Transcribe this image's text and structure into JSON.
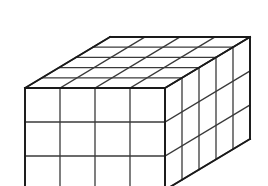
{
  "figure": {
    "shape_name": "cuboid",
    "projection": "oblique",
    "background_color": "#ffffff",
    "line_color": "#2b2b2b",
    "face_color": "#ffffff",
    "caption": ""
  },
  "chart_data": {
    "type": "diagram",
    "shape": "rectangular prism (cuboid)",
    "units": "unit cubes",
    "dimensions": {
      "width_cubes": 4,
      "height_cubes": 3,
      "depth_cubes": 5
    },
    "total_cubes": 60,
    "faces": [
      {
        "name": "front",
        "visible": true,
        "rows": 3,
        "columns": 4,
        "cells": 12
      },
      {
        "name": "right",
        "visible": true,
        "rows": 3,
        "columns": 5,
        "cells": 15
      },
      {
        "name": "top",
        "visible": true,
        "rows": 5,
        "columns": 4,
        "cells": 20
      },
      {
        "name": "back",
        "visible": false,
        "rows": 3,
        "columns": 4,
        "cells": 12
      },
      {
        "name": "left",
        "visible": false,
        "rows": 3,
        "columns": 5,
        "cells": 15
      },
      {
        "name": "bottom",
        "visible": false,
        "rows": 5,
        "columns": 4,
        "cells": 20
      }
    ],
    "geometry": {
      "front_top_left_x": 25,
      "front_top_left_y": 88,
      "cell_width": 35,
      "cell_height": 34,
      "depth_step_x": 17,
      "depth_step_y": -10.2
    },
    "xlabel": "",
    "ylabel": "",
    "grid": true,
    "legend": "none"
  }
}
